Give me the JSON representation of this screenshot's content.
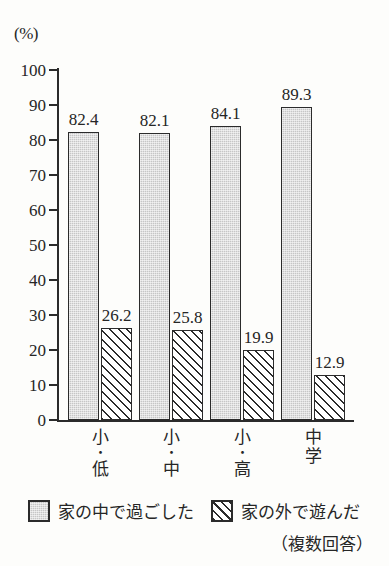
{
  "chart_data": {
    "type": "bar",
    "title": "",
    "subtitle": "",
    "xlabel": "",
    "ylabel": "",
    "unit_label": "(%)",
    "ylim": [
      0,
      100
    ],
    "ytick_step": 10,
    "yticks": [
      100,
      90,
      80,
      70,
      60,
      50,
      40,
      30,
      20,
      10,
      0
    ],
    "ytick_labels": [
      "100",
      "90",
      "80",
      "70",
      "60",
      "50",
      "40",
      "30",
      "20",
      "10",
      "0"
    ],
    "grid": false,
    "legend_position": "bottom",
    "categories": [
      "小・低",
      "小・中",
      "小・高",
      "中学"
    ],
    "category_lines": [
      [
        "小",
        "・",
        "低"
      ],
      [
        "小",
        "・",
        "中"
      ],
      [
        "小",
        "・",
        "高"
      ],
      [
        "中",
        "学"
      ]
    ],
    "series": [
      {
        "name": "家の中で過ごした",
        "style": "solid-gray",
        "values": [
          82.4,
          82.1,
          84.1,
          89.3
        ],
        "value_labels": [
          "82.4",
          "82.1",
          "84.1",
          "89.3"
        ]
      },
      {
        "name": "家の外で遊んだ",
        "style": "diagonal-hatch",
        "values": [
          26.2,
          25.8,
          19.9,
          12.9
        ],
        "value_labels": [
          "26.2",
          "25.8",
          "19.9",
          "12.9"
        ]
      }
    ],
    "annotations": [
      "（複数回答）"
    ]
  },
  "legend": {
    "items": [
      {
        "label": "家の中で過ごした",
        "style": "solid-gray"
      },
      {
        "label": "家の外で遊んだ",
        "style": "diagonal-hatch"
      }
    ]
  },
  "footnote": "（複数回答）",
  "colors": {
    "ink": "#2b2b2b",
    "bar_gray": "#c6c6c6",
    "background": "#fdfdfb",
    "hatch_line": "#2b2b2b",
    "hatch_bg": "#ffffff"
  }
}
